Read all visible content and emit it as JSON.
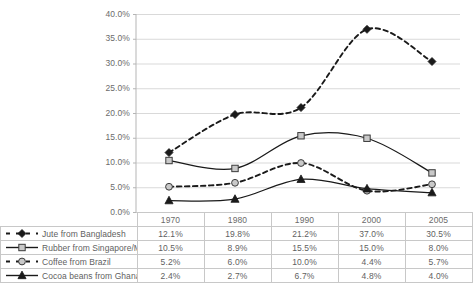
{
  "chart_data": {
    "type": "line",
    "title": "",
    "xlabel": "",
    "ylabel": "",
    "categories": [
      "1970",
      "1980",
      "1990",
      "2000",
      "2005"
    ],
    "ylim": [
      0,
      40
    ],
    "ytick_labels": [
      "0.0%",
      "5.0%",
      "10.0%",
      "15.0%",
      "20.0%",
      "25.0%",
      "30.0%",
      "35.0%",
      "40.0%"
    ],
    "ytick_values": [
      0,
      5,
      10,
      15,
      20,
      25,
      30,
      35,
      40
    ],
    "grid": true,
    "legend_position": "table-below",
    "smoothed": true,
    "series": [
      {
        "name": "Jute from Bangladesh",
        "values": [
          12.1,
          19.8,
          21.2,
          37.0,
          30.5
        ],
        "labels": [
          "12.1%",
          "19.8%",
          "21.2%",
          "37.0%",
          "30.5%"
        ],
        "marker": "diamond",
        "marker_fill": "#1a1a1a",
        "line_style": "dashed",
        "color": "#1a1a1a"
      },
      {
        "name": "Rubber from Singapore/Malaysia",
        "values": [
          10.5,
          8.9,
          15.5,
          15.0,
          8.0
        ],
        "labels": [
          "10.5%",
          "8.9%",
          "15.5%",
          "15.0%",
          "8.0%"
        ],
        "marker": "square",
        "marker_fill": "#c9c9c9",
        "line_style": "solid",
        "color": "#1a1a1a"
      },
      {
        "name": "Coffee from Brazil",
        "values": [
          5.2,
          6.0,
          10.0,
          4.4,
          5.7
        ],
        "labels": [
          "5.2%",
          "6.0%",
          "10.0%",
          "4.4%",
          "5.7%"
        ],
        "marker": "circle",
        "marker_fill": "#c9c9c9",
        "line_style": "dashed",
        "color": "#1a1a1a"
      },
      {
        "name": "Cocoa beans from Ghana",
        "values": [
          2.4,
          2.7,
          6.7,
          4.8,
          4.0
        ],
        "labels": [
          "2.4%",
          "2.7%",
          "6.7%",
          "4.8%",
          "4.0%"
        ],
        "marker": "triangle",
        "marker_fill": "#1a1a1a",
        "line_style": "solid",
        "color": "#1a1a1a"
      }
    ]
  },
  "colors": {
    "grid": "#d9d9d9",
    "axis": "#b5b5b5",
    "table_border": "#c8c8c8",
    "text": "#5f5f5f",
    "marker_open_fill": "#c9c9c9",
    "line": "#1a1a1a"
  }
}
